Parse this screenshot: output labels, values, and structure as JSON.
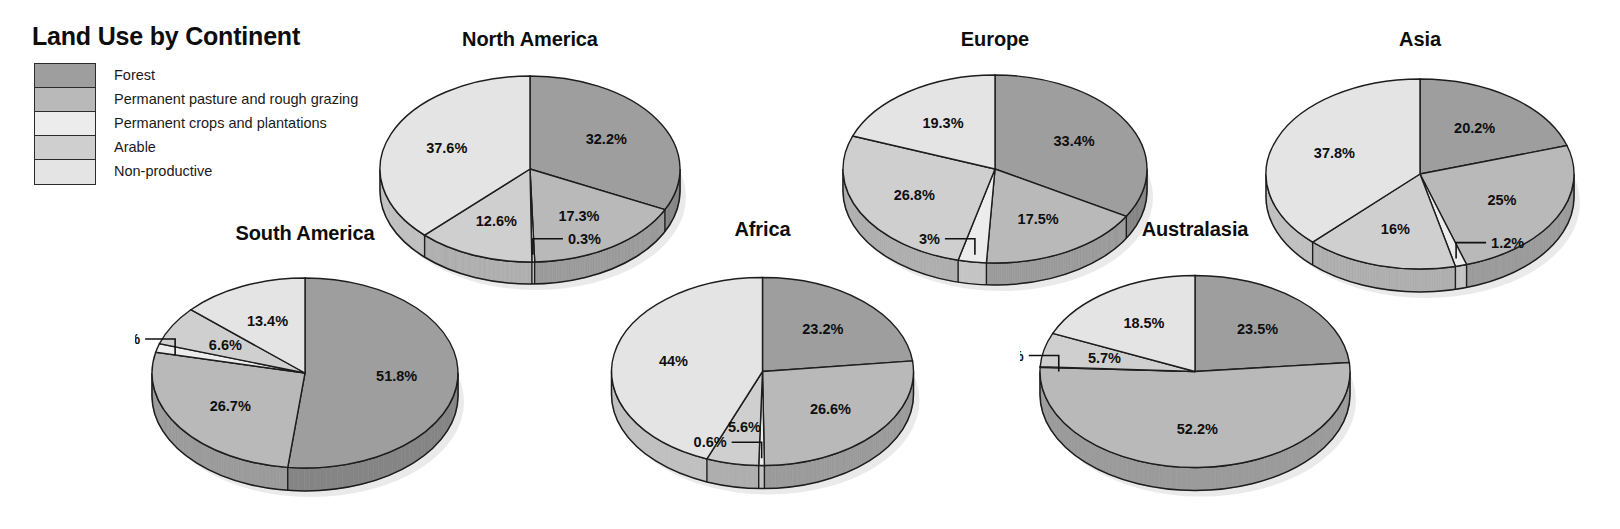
{
  "legend": {
    "title": "Land Use by Continent",
    "items": [
      {
        "label": "Forest",
        "color": "#9e9e9e"
      },
      {
        "label": "Permanent pasture and rough grazing",
        "color": "#b9b9b9"
      },
      {
        "label": "Permanent crops and plantations",
        "color": "#ececec"
      },
      {
        "label": "Arable",
        "color": "#cfcfcf"
      },
      {
        "label": "Non-productive",
        "color": "#e4e4e4"
      }
    ]
  },
  "chart_data": {
    "type": "pie",
    "title": "Land Use by Continent",
    "categories": [
      "Forest",
      "Permanent pasture and rough grazing",
      "Permanent crops and plantations",
      "Arable",
      "Non-productive"
    ],
    "colors": [
      "#9e9e9e",
      "#b9b9b9",
      "#ececec",
      "#cfcfcf",
      "#e4e4e4"
    ],
    "unit": "%",
    "charts": [
      {
        "name": "north-america",
        "title": "North America",
        "values": [
          32.2,
          17.3,
          0.3,
          12.6,
          37.6
        ],
        "labels": [
          "32.2%",
          "17.3%",
          "0.3%",
          "12.6%",
          "37.6%"
        ],
        "leader": [
          "Permanent crops and plantations"
        ]
      },
      {
        "name": "south-america",
        "title": "South America",
        "values": [
          51.8,
          26.7,
          1.5,
          6.6,
          13.4
        ],
        "labels": [
          "51.8%",
          "26.7%",
          "1.5%",
          "6.6%",
          "13.4%"
        ],
        "leader": [
          "Permanent crops and plantations"
        ]
      },
      {
        "name": "europe",
        "title": "Europe",
        "values": [
          33.4,
          17.5,
          3,
          26.8,
          19.3
        ],
        "labels": [
          "33.4%",
          "17.5%",
          "3%",
          "26.8%",
          "19.3%"
        ],
        "leader": [
          "Permanent crops and plantations"
        ]
      },
      {
        "name": "africa",
        "title": "Africa",
        "values": [
          23.2,
          26.6,
          0.6,
          5.6,
          44
        ],
        "labels": [
          "23.2%",
          "26.6%",
          "0.6%",
          "5.6%",
          "44%"
        ],
        "leader": [
          "Permanent crops and plantations"
        ]
      },
      {
        "name": "asia",
        "title": "Asia",
        "values": [
          20.2,
          25,
          1.2,
          16,
          37.8
        ],
        "labels": [
          "20.2%",
          "25%",
          "1.2%",
          "16%",
          "37.8%"
        ],
        "leader": [
          "Permanent crops and plantations"
        ]
      },
      {
        "name": "australasia",
        "title": "Australasia",
        "values": [
          23.5,
          52.2,
          0.1,
          5.7,
          18.5
        ],
        "labels": [
          "23.5%",
          "52.2%",
          "0.1%",
          "5.7%",
          "18.5%"
        ],
        "leader": [
          "Permanent crops and plantations"
        ]
      }
    ]
  },
  "layout": {
    "panels": [
      {
        "name": "north-america",
        "left": 360,
        "top": 28,
        "width": 340,
        "height": 240,
        "rx": 150,
        "ry": 93,
        "depth": 22
      },
      {
        "name": "europe",
        "left": 820,
        "top": 28,
        "width": 350,
        "height": 240,
        "rx": 152,
        "ry": 94,
        "depth": 22
      },
      {
        "name": "asia",
        "left": 1245,
        "top": 28,
        "width": 350,
        "height": 250,
        "rx": 154,
        "ry": 95,
        "depth": 23
      },
      {
        "name": "south-america",
        "left": 135,
        "top": 222,
        "width": 340,
        "height": 260,
        "rx": 153,
        "ry": 95,
        "depth": 23
      },
      {
        "name": "africa",
        "left": 590,
        "top": 218,
        "width": 345,
        "height": 265,
        "rx": 151,
        "ry": 94,
        "depth": 23
      },
      {
        "name": "australasia",
        "left": 1020,
        "top": 218,
        "width": 350,
        "height": 265,
        "rx": 155,
        "ry": 96,
        "depth": 23
      }
    ]
  }
}
